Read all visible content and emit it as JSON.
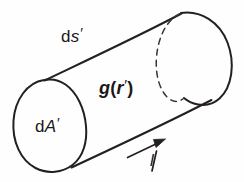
{
  "figure": {
    "kind": "physics-diagram",
    "background_color": "#fefefe",
    "ink_color": "#241f20",
    "labels": {
      "arc_length": {
        "name": "ds-prime",
        "prefix": "d",
        "symbol": "s",
        "prime": "′",
        "full_text": "ds′"
      },
      "area_element": {
        "name": "dA-prime",
        "prefix": "d",
        "symbol": "A",
        "prime": "′",
        "full_text": "dA′"
      },
      "field": {
        "name": "g-of-r-prime",
        "symbol": "g",
        "open_paren": "(",
        "argument": "r",
        "prime": "′",
        "close_paren": ")",
        "full_text": "g(r′)"
      },
      "direction": {
        "name": "l-direction",
        "symbol": "l",
        "full_text": "l"
      }
    },
    "elements": {
      "near_cap": "solid-ellipse",
      "far_cap_visible": "solid-arc",
      "far_cap_hidden": "dashed-arc",
      "top_generator": "solid-line",
      "bottom_generator": "solid-line",
      "direction_arrow": "solid-arrow-with-head"
    }
  }
}
